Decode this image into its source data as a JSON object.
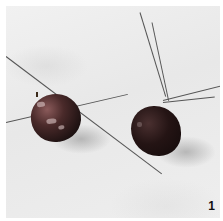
{
  "figure": {
    "number": "1"
  },
  "colors": {
    "background": "#ffffff",
    "marble": "#eeeeee",
    "apple_dark": "#1e1212",
    "wire": "#555555"
  }
}
